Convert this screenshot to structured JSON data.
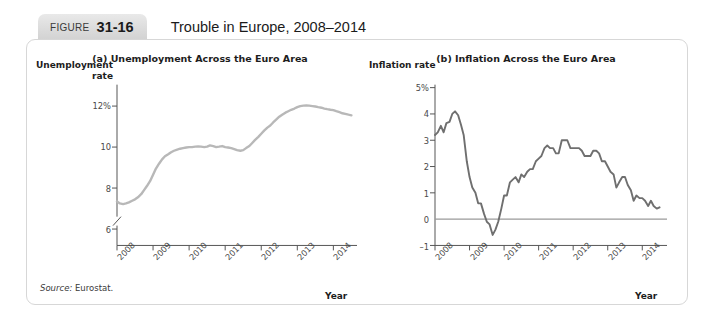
{
  "header": {
    "badge_label": "FIGURE",
    "badge_number": "31-16",
    "title": "Trouble in Europe, 2008–2014"
  },
  "source": {
    "prefix": "Source:",
    "text": "Eurostat."
  },
  "colors": {
    "unemployment_line": "#b8b8b8",
    "inflation_line": "#6f6f6f",
    "axis": "#555555",
    "zero_line": "#9a9a9a",
    "badge_bg": "#dcdcdc",
    "card_border": "#d7d7d7"
  },
  "chart_data": [
    {
      "type": "line",
      "panel": "a",
      "title": "(a) Unemployment Across the Euro Area",
      "ylabel": "Unemployment rate",
      "xlabel": "Year",
      "ylabel_lines": [
        "Unemployment",
        "rate"
      ],
      "yticks": [
        "12%",
        "10",
        "8",
        "6"
      ],
      "ytick_values": [
        12,
        10,
        8,
        6
      ],
      "xticks": [
        "2008",
        "2009",
        "2010",
        "2011",
        "2012",
        "2013",
        "2014"
      ],
      "xtick_values": [
        2008,
        2009,
        2010,
        2011,
        2012,
        2013,
        2014
      ],
      "ylim": [
        5.2,
        12.9
      ],
      "xlim": [
        2008.0,
        2014.6
      ],
      "axis_break": true,
      "grid": false,
      "legend": "none",
      "series": [
        {
          "name": "Euro area unemployment rate",
          "color": "#b8b8b8",
          "x": [
            2008.0,
            2008.08,
            2008.17,
            2008.25,
            2008.33,
            2008.42,
            2008.5,
            2008.58,
            2008.67,
            2008.75,
            2008.83,
            2008.92,
            2009.0,
            2009.08,
            2009.17,
            2009.25,
            2009.33,
            2009.42,
            2009.5,
            2009.58,
            2009.67,
            2009.75,
            2009.83,
            2009.92,
            2010.0,
            2010.08,
            2010.17,
            2010.25,
            2010.33,
            2010.42,
            2010.5,
            2010.58,
            2010.67,
            2010.75,
            2010.83,
            2010.92,
            2011.0,
            2011.08,
            2011.17,
            2011.25,
            2011.33,
            2011.42,
            2011.5,
            2011.58,
            2011.67,
            2011.75,
            2011.83,
            2011.92,
            2012.0,
            2012.08,
            2012.17,
            2012.25,
            2012.33,
            2012.42,
            2012.5,
            2012.58,
            2012.67,
            2012.75,
            2012.83,
            2012.92,
            2013.0,
            2013.08,
            2013.17,
            2013.25,
            2013.33,
            2013.42,
            2013.5,
            2013.58,
            2013.67,
            2013.75,
            2013.83,
            2013.92,
            2014.0,
            2014.08,
            2014.17,
            2014.25,
            2014.33,
            2014.42,
            2014.5
          ],
          "y": [
            7.35,
            7.25,
            7.22,
            7.25,
            7.3,
            7.38,
            7.45,
            7.55,
            7.7,
            7.9,
            8.1,
            8.35,
            8.65,
            8.95,
            9.2,
            9.4,
            9.55,
            9.65,
            9.75,
            9.82,
            9.88,
            9.92,
            9.95,
            9.98,
            10.0,
            10.0,
            10.02,
            10.03,
            10.02,
            10.0,
            10.02,
            10.08,
            10.05,
            10.0,
            10.02,
            10.05,
            10.0,
            9.98,
            9.95,
            9.9,
            9.85,
            9.82,
            9.85,
            9.95,
            10.05,
            10.2,
            10.35,
            10.5,
            10.65,
            10.8,
            10.95,
            11.05,
            11.2,
            11.35,
            11.48,
            11.58,
            11.68,
            11.75,
            11.82,
            11.88,
            11.95,
            12.0,
            12.02,
            12.03,
            12.02,
            12.0,
            11.98,
            11.95,
            11.92,
            11.88,
            11.85,
            11.82,
            11.8,
            11.75,
            11.7,
            11.65,
            11.62,
            11.58,
            11.55
          ]
        }
      ]
    },
    {
      "type": "line",
      "panel": "b",
      "title": "(b) Inflation Across the Euro Area",
      "ylabel": "Inflation rate",
      "xlabel": "Year",
      "ylabel_lines": [
        "Inflation rate"
      ],
      "yticks": [
        "5%",
        "4",
        "3",
        "2",
        "1",
        "0",
        "–1"
      ],
      "ytick_values": [
        5,
        4,
        3,
        2,
        1,
        0,
        -1
      ],
      "xticks": [
        "2008",
        "2009",
        "2010",
        "2011",
        "2012",
        "2013",
        "2014"
      ],
      "xtick_values": [
        2008,
        2009,
        2010,
        2011,
        2012,
        2013,
        2014
      ],
      "ylim": [
        -1,
        5
      ],
      "xlim": [
        2008.0,
        2014.6
      ],
      "zero_line": 0,
      "grid": false,
      "legend": "none",
      "series": [
        {
          "name": "Euro area inflation rate",
          "color": "#6f6f6f",
          "x": [
            2008.0,
            2008.08,
            2008.17,
            2008.25,
            2008.33,
            2008.42,
            2008.5,
            2008.58,
            2008.67,
            2008.75,
            2008.83,
            2008.92,
            2009.0,
            2009.08,
            2009.17,
            2009.25,
            2009.33,
            2009.42,
            2009.5,
            2009.58,
            2009.67,
            2009.75,
            2009.83,
            2009.92,
            2010.0,
            2010.08,
            2010.17,
            2010.25,
            2010.33,
            2010.42,
            2010.5,
            2010.58,
            2010.67,
            2010.75,
            2010.83,
            2010.92,
            2011.0,
            2011.08,
            2011.17,
            2011.25,
            2011.33,
            2011.42,
            2011.5,
            2011.58,
            2011.67,
            2011.75,
            2011.83,
            2011.92,
            2012.0,
            2012.08,
            2012.17,
            2012.25,
            2012.33,
            2012.42,
            2012.5,
            2012.58,
            2012.67,
            2012.75,
            2012.83,
            2012.92,
            2013.0,
            2013.08,
            2013.17,
            2013.25,
            2013.33,
            2013.42,
            2013.5,
            2013.58,
            2013.67,
            2013.75,
            2013.83,
            2013.92,
            2014.0,
            2014.08,
            2014.17,
            2014.25,
            2014.33,
            2014.42,
            2014.5
          ],
          "y": [
            3.2,
            3.3,
            3.55,
            3.3,
            3.65,
            3.7,
            4.0,
            4.1,
            3.95,
            3.6,
            3.2,
            2.2,
            1.6,
            1.2,
            1.0,
            0.6,
            0.6,
            0.2,
            -0.1,
            -0.2,
            -0.6,
            -0.4,
            -0.1,
            0.4,
            0.9,
            0.9,
            1.4,
            1.5,
            1.6,
            1.4,
            1.7,
            1.6,
            1.8,
            1.9,
            1.9,
            2.2,
            2.3,
            2.4,
            2.7,
            2.8,
            2.7,
            2.7,
            2.5,
            2.5,
            3.0,
            3.0,
            3.0,
            2.7,
            2.7,
            2.7,
            2.7,
            2.6,
            2.4,
            2.4,
            2.4,
            2.6,
            2.6,
            2.5,
            2.2,
            2.2,
            2.0,
            1.8,
            1.7,
            1.2,
            1.4,
            1.6,
            1.6,
            1.3,
            1.1,
            0.7,
            0.9,
            0.8,
            0.8,
            0.7,
            0.5,
            0.7,
            0.5,
            0.4,
            0.45
          ]
        }
      ]
    }
  ]
}
